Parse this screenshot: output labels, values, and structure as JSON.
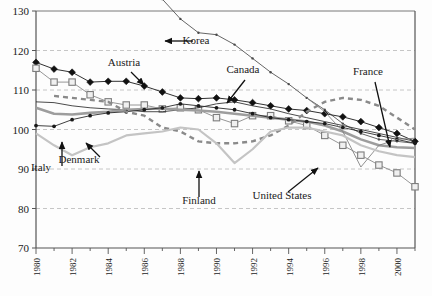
{
  "chart_data": {
    "type": "line",
    "title": "",
    "xlabel": "",
    "ylabel": "",
    "xlim": [
      1980,
      2001
    ],
    "ylim": [
      70,
      130
    ],
    "yticks": [
      70,
      80,
      90,
      100,
      110,
      120,
      130
    ],
    "xticks": [
      1980,
      1982,
      1984,
      1986,
      1988,
      1990,
      1992,
      1994,
      1996,
      1998,
      2000
    ],
    "x": [
      1980,
      1981,
      1982,
      1983,
      1984,
      1985,
      1986,
      1987,
      1988,
      1989,
      1990,
      1991,
      1992,
      1993,
      1994,
      1995,
      1996,
      1997,
      1998,
      1999,
      2000,
      2001
    ],
    "grid": "horizontal-dashed",
    "legend": "inline-annotations",
    "series": [
      {
        "name": "Korea",
        "style": "thin-line-small-dot",
        "color": "#4a4a4a",
        "values": [
          null,
          null,
          null,
          null,
          null,
          null,
          138.5,
          133.0,
          128.0,
          124.5,
          124.0,
          121.5,
          118.0,
          114.5,
          111.5,
          108.0,
          105.0,
          101.5,
          99.0,
          97.5,
          97.0,
          96.5
        ]
      },
      {
        "name": "Austria",
        "style": "line-filled-diamond",
        "color": "#1a1a1a",
        "values": [
          117.0,
          115.3,
          114.5,
          112.0,
          112.2,
          112.2,
          111.0,
          109.5,
          108.0,
          107.8,
          108.0,
          107.5,
          106.8,
          106.0,
          105.2,
          104.8,
          104.0,
          103.2,
          102.0,
          100.5,
          99.0,
          97.0
        ]
      },
      {
        "name": "Canada",
        "style": "line-open-square",
        "color": "#8a8a8a",
        "values": [
          115.5,
          112.0,
          112.0,
          108.8,
          107.0,
          106.2,
          106.2,
          105.2,
          105.5,
          105.0,
          103.0,
          101.5,
          103.5,
          103.5,
          102.2,
          101.0,
          98.5,
          96.0,
          93.5,
          91.0,
          89.0,
          85.5
        ]
      },
      {
        "name": "France",
        "style": "thin-line",
        "color": "#2a2a2a",
        "values": [
          107.0,
          106.8,
          106.0,
          105.5,
          105.2,
          105.0,
          104.5,
          104.5,
          105.0,
          105.5,
          106.5,
          107.0,
          106.0,
          105.2,
          104.0,
          103.0,
          102.0,
          101.0,
          100.0,
          99.0,
          98.0,
          97.0
        ]
      },
      {
        "name": "Denmark",
        "style": "thick-gray-line",
        "color": "#9d9d9d",
        "values": [
          105.5,
          104.0,
          103.8,
          104.2,
          104.5,
          105.0,
          105.2,
          105.3,
          105.0,
          104.8,
          104.5,
          104.0,
          103.5,
          103.0,
          102.5,
          102.0,
          101.0,
          99.5,
          97.5,
          96.0,
          95.5,
          95.3
        ]
      },
      {
        "name": "Italy",
        "style": "line-small-dot",
        "color": "#2a2a2a",
        "values": [
          101.0,
          100.8,
          102.5,
          103.5,
          104.2,
          104.5,
          105.0,
          105.5,
          106.5,
          106.0,
          105.5,
          105.0,
          104.0,
          103.0,
          102.5,
          102.0,
          101.5,
          100.5,
          99.5,
          98.5,
          97.5,
          96.5
        ]
      },
      {
        "name": "United States",
        "style": "thin-line-v",
        "color": "#7d7d7d",
        "values": [
          null,
          null,
          null,
          null,
          null,
          null,
          null,
          null,
          null,
          null,
          null,
          null,
          null,
          null,
          null,
          108.0,
          104.5,
          99.5,
          90.5,
          96.0,
          97.5,
          97.8
        ]
      },
      {
        "name": "Finland",
        "style": "dashed-gray",
        "color": "#8a8a8a",
        "values": [
          null,
          108.5,
          108.0,
          107.5,
          107.0,
          104.5,
          103.5,
          100.5,
          99.5,
          97.0,
          96.5,
          96.5,
          97.0,
          98.5,
          101.0,
          104.5,
          107.0,
          108.0,
          107.5,
          106.0,
          103.0,
          100.0
        ]
      },
      {
        "name": "Sweden",
        "style": "light-gray-line",
        "color": "#c4c4c4",
        "values": [
          99.0,
          96.0,
          93.5,
          95.5,
          96.5,
          98.5,
          99.0,
          99.5,
          100.5,
          100.0,
          96.5,
          91.5,
          95.0,
          99.5,
          100.5,
          100.5,
          99.5,
          98.5,
          96.0,
          94.5,
          93.5,
          93.0
        ]
      }
    ],
    "annotations": [
      {
        "label": "Korea",
        "x": 196,
        "y": 44,
        "arrow": "left-horizontal"
      },
      {
        "label": "Austria",
        "x": 124,
        "y": 66,
        "arrow": "down-right"
      },
      {
        "label": "Canada",
        "x": 243,
        "y": 73,
        "arrow": "down-left"
      },
      {
        "label": "France",
        "x": 368,
        "y": 75,
        "arrow": "down-left"
      },
      {
        "label": "Italy",
        "x": 41,
        "y": 171,
        "arrow": "up-vertical"
      },
      {
        "label": "Denmark",
        "x": 79,
        "y": 163,
        "arrow": "up-right"
      },
      {
        "label": "Finland",
        "x": 199,
        "y": 204,
        "arrow": "up-vertical"
      },
      {
        "label": "United States",
        "x": 282,
        "y": 199,
        "arrow": "up-right"
      }
    ]
  },
  "colors": {
    "grid": "#b8b8b8",
    "axis": "#555555",
    "background": "#fdfdfd",
    "text": "#1a1a1a"
  }
}
